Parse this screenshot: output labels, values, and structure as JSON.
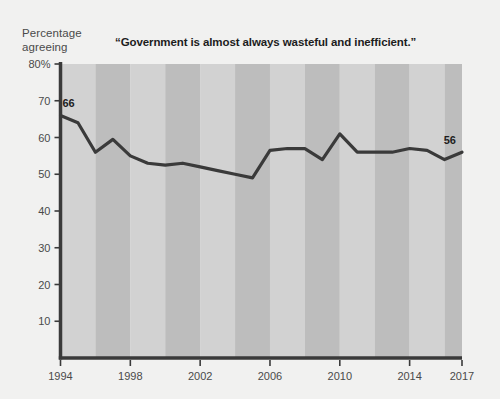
{
  "axis_label": {
    "y_caption_line1": "Percentage",
    "y_caption_line2": "agreeing"
  },
  "colors": {
    "background": "#f1f1f0",
    "band_light": "#d2d2d2",
    "band_dark": "#bdbdbd",
    "line": "#3a3a3a",
    "axis": "#3a3a3a",
    "text": "#4a4a4a",
    "title_text": "#1d1d1d"
  },
  "chart_data": {
    "type": "line",
    "title": "“Government is almost always wasteful and inefficient.”",
    "xlabel": "",
    "ylabel": "Percentage agreeing",
    "ylim": [
      0,
      80
    ],
    "xlim": [
      1994,
      2017
    ],
    "grid": false,
    "legend": "none",
    "y_ticks": [
      10,
      20,
      30,
      40,
      50,
      60,
      70,
      80
    ],
    "y_tick_labels": [
      "10",
      "20",
      "30",
      "40",
      "50",
      "60",
      "70",
      "80%"
    ],
    "x_ticks": [
      1994,
      1998,
      2002,
      2006,
      2010,
      2014,
      2017
    ],
    "x_tick_labels": [
      "1994",
      "1998",
      "2002",
      "2006",
      "2010",
      "2014",
      "2017"
    ],
    "band_years": [
      [
        1994,
        1996
      ],
      [
        1996,
        1998
      ],
      [
        1998,
        2000
      ],
      [
        2000,
        2002
      ],
      [
        2002,
        2004
      ],
      [
        2004,
        2006
      ],
      [
        2006,
        2008
      ],
      [
        2008,
        2010
      ],
      [
        2010,
        2012
      ],
      [
        2012,
        2014
      ],
      [
        2014,
        2016
      ],
      [
        2016,
        2017
      ]
    ],
    "x": [
      1994,
      1995,
      1996,
      1997,
      1998,
      1999,
      2000,
      2001,
      2002,
      2003,
      2004,
      2005,
      2006,
      2007,
      2008,
      2009,
      2010,
      2011,
      2012,
      2013,
      2014,
      2015,
      2016,
      2017
    ],
    "values": [
      66,
      64,
      56,
      59.5,
      55,
      53,
      52.5,
      53,
      52,
      51,
      50,
      49,
      56.5,
      57,
      57,
      54,
      61,
      56,
      56,
      56,
      57,
      56.5,
      54,
      56
    ],
    "annotations": [
      {
        "x": 1994,
        "y": 66,
        "text": "66",
        "position": "above-right"
      },
      {
        "x": 2017,
        "y": 56,
        "text": "56",
        "position": "above-left"
      }
    ]
  }
}
